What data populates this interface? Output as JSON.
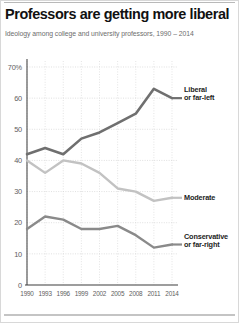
{
  "header": {
    "title": "Professors are getting more liberal",
    "subtitle": "Ideology among college and university professors, 1990 – 2014"
  },
  "axes": {
    "y_ticks": [
      "70%",
      "60",
      "50",
      "40",
      "30",
      "20",
      "10",
      "0"
    ],
    "x_ticks": [
      "1990",
      "1993",
      "1996",
      "1999",
      "2002",
      "2005",
      "2008",
      "2011",
      "2014"
    ]
  },
  "series_labels": {
    "liberal_line1": "Liberal",
    "liberal_line2": "or far-left",
    "moderate": "Moderate",
    "conservative_line1": "Conservative",
    "conservative_line2": "or far-right"
  },
  "colors": {
    "liberal": "#6f6f6f",
    "moderate": "#c2c2c2",
    "conservative": "#8a8a8a",
    "grid": "#d2d2d2",
    "axis": "#4a4a4a",
    "title": "#111111",
    "subtitle": "#6d6d6d"
  },
  "chart_data": {
    "type": "line",
    "title": "Professors are getting more liberal",
    "subtitle": "Ideology among college and university professors, 1990 – 2014",
    "xlabel": "",
    "ylabel": "",
    "ylim": [
      0,
      70
    ],
    "ytick_values": [
      0,
      10,
      20,
      30,
      40,
      50,
      60,
      70
    ],
    "grid": true,
    "legend_position": "right-inline",
    "x": [
      1990,
      1993,
      1996,
      1999,
      2002,
      2005,
      2008,
      2011,
      2014
    ],
    "categories": [
      "1990",
      "1993",
      "1996",
      "1999",
      "2002",
      "2005",
      "2008",
      "2011",
      "2014"
    ],
    "series": [
      {
        "name": "Liberal or far-left",
        "color": "#6f6f6f",
        "values": [
          42,
          44,
          42,
          47,
          49,
          52,
          55,
          63,
          60
        ]
      },
      {
        "name": "Moderate",
        "color": "#c2c2c2",
        "values": [
          40,
          36,
          40,
          39,
          36,
          31,
          30,
          27,
          28
        ]
      },
      {
        "name": "Conservative or far-right",
        "color": "#8a8a8a",
        "values": [
          18,
          22,
          21,
          18,
          18,
          19,
          16,
          12,
          13
        ]
      }
    ]
  }
}
